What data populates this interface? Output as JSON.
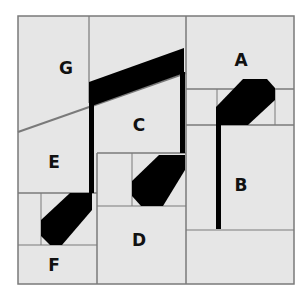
{
  "diagram": {
    "background_color": "#ffffff",
    "panel_fill": "#e6e6e6",
    "grid_line_color": "#7a7a7a",
    "shape_color": "#000000",
    "pieces": [
      {
        "label": "G",
        "x": 66,
        "y": 68
      },
      {
        "label": "A",
        "x": 241,
        "y": 60
      },
      {
        "label": "C",
        "x": 139,
        "y": 125
      },
      {
        "label": "E",
        "x": 54,
        "y": 162
      },
      {
        "label": "B",
        "x": 241,
        "y": 185
      },
      {
        "label": "D",
        "x": 139,
        "y": 240
      },
      {
        "label": "F",
        "x": 54,
        "y": 265
      }
    ]
  }
}
